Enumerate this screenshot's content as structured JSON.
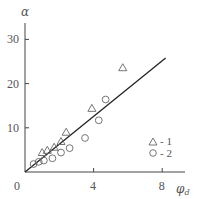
{
  "chart_data": {
    "type": "scatter",
    "title": "",
    "xlabel": "φ_d",
    "ylabel": "α",
    "xlim": [
      0,
      9.5
    ],
    "ylim": [
      0,
      34
    ],
    "x_ticks": [
      0,
      4,
      8
    ],
    "x_tick_labels": [
      "0",
      "4",
      "8"
    ],
    "y_ticks": [
      10,
      20,
      30
    ],
    "y_tick_labels": [
      "10",
      "20",
      "30"
    ],
    "grid": false,
    "legend_position": "lower right",
    "series": [
      {
        "name": "1",
        "marker": "triangle",
        "points": [
          {
            "x": 1.0,
            "y": 4.4
          },
          {
            "x": 1.3,
            "y": 4.9
          },
          {
            "x": 1.7,
            "y": 5.6
          },
          {
            "x": 2.1,
            "y": 6.9
          },
          {
            "x": 2.4,
            "y": 9.0
          },
          {
            "x": 3.9,
            "y": 14.4
          },
          {
            "x": 5.7,
            "y": 23.6
          }
        ]
      },
      {
        "name": "2",
        "marker": "circle",
        "points": [
          {
            "x": 0.5,
            "y": 1.8
          },
          {
            "x": 0.8,
            "y": 2.3
          },
          {
            "x": 1.1,
            "y": 2.6
          },
          {
            "x": 1.6,
            "y": 3.1
          },
          {
            "x": 2.1,
            "y": 4.4
          },
          {
            "x": 2.6,
            "y": 5.4
          },
          {
            "x": 3.5,
            "y": 7.7
          },
          {
            "x": 4.3,
            "y": 11.7
          },
          {
            "x": 4.7,
            "y": 16.4
          }
        ]
      }
    ],
    "fit_line": {
      "x": [
        0,
        8.2
      ],
      "y": [
        0,
        25.8
      ]
    }
  },
  "legend": {
    "items": [
      {
        "marker": "triangle",
        "label": "- 1"
      },
      {
        "marker": "circle",
        "label": "- 2"
      }
    ]
  },
  "axes": {
    "x_label_main": "φ",
    "x_label_sub": "d",
    "y_label": "α",
    "origin_label": "0"
  }
}
